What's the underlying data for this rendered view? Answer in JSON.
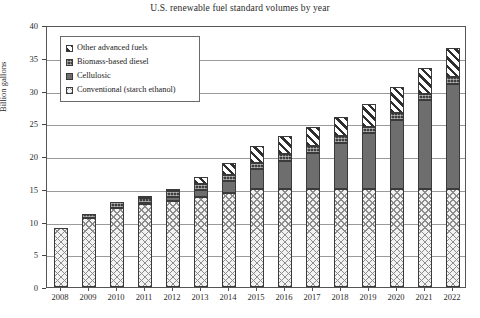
{
  "chart_data": {
    "type": "bar",
    "title": "U.S. renewable fuel standard volumes by year",
    "xlabel": "",
    "ylabel": "Billion gallons",
    "ylim": [
      0,
      40
    ],
    "ytick_values": [
      0,
      5,
      10,
      15,
      20,
      25,
      30,
      35,
      40
    ],
    "grid": true,
    "stacked": true,
    "legend_position": "upper-left-inside",
    "categories": [
      "2008",
      "2009",
      "2010",
      "2011",
      "2012",
      "2013",
      "2014",
      "2015",
      "2016",
      "2017",
      "2018",
      "2019",
      "2020",
      "2021",
      "2022"
    ],
    "series": [
      {
        "name": "Conventional (starch ethanol)",
        "pattern": "cross-hatch-light",
        "values": [
          9.0,
          10.5,
          12.0,
          12.6,
          13.2,
          13.8,
          14.4,
          15.0,
          15.0,
          15.0,
          15.0,
          15.0,
          15.0,
          15.0,
          15.0
        ]
      },
      {
        "name": "Cellulosic",
        "pattern": "solid-gray",
        "values": [
          0.0,
          0.0,
          0.1,
          0.25,
          0.5,
          1.0,
          1.75,
          3.0,
          4.25,
          5.5,
          7.0,
          8.5,
          10.5,
          13.5,
          16.0
        ]
      },
      {
        "name": "Biomass-based diesel",
        "pattern": "dark-dotted",
        "values": [
          0.0,
          0.6,
          0.85,
          0.8,
          1.0,
          1.0,
          1.0,
          1.0,
          1.0,
          1.0,
          1.0,
          1.0,
          1.0,
          1.0,
          1.0
        ]
      },
      {
        "name": "Other advanced fuels",
        "pattern": "diagonal-stripe",
        "values": [
          0.0,
          0.0,
          0.0,
          0.05,
          0.3,
          1.0,
          1.75,
          2.5,
          2.75,
          3.0,
          3.0,
          3.5,
          4.0,
          4.0,
          4.5
        ]
      }
    ],
    "totals": [
      9.0,
      11.1,
      12.95,
      13.7,
      15.0,
      16.8,
      18.9,
      21.5,
      23.0,
      24.5,
      26.0,
      28.0,
      30.5,
      33.5,
      36.5
    ],
    "colors": {
      "conventional": "#f2f2f2",
      "cellulosic": "#6e6e6e",
      "biomass": "#3f3f3f",
      "other": "#ffffff",
      "axis": "#555555",
      "grid": "#9a9a9a",
      "text": "#222222"
    }
  },
  "legend": {
    "items": [
      {
        "label": "Other advanced fuels"
      },
      {
        "label": "Biomass-based diesel"
      },
      {
        "label": "Cellulosic"
      },
      {
        "label": "Conventional (starch ethanol)"
      }
    ]
  }
}
